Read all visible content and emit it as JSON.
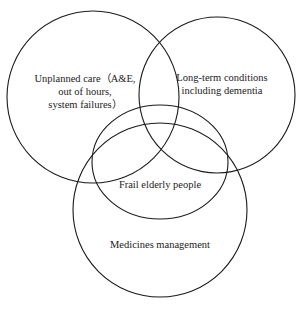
{
  "diagram": {
    "type": "venn",
    "stroke_color": "#1a1a1a",
    "sets": [
      {
        "id": "unplanned-care",
        "label": "Unplanned care（A&E,\nout of hours,\nsystem failures）"
      },
      {
        "id": "long-term-conditions",
        "label": "Long-term conditions\nincluding dementia"
      },
      {
        "id": "frail-elderly",
        "label": "Frail elderly people"
      },
      {
        "id": "medicines-management",
        "label": "Medicines management"
      }
    ]
  }
}
